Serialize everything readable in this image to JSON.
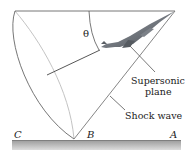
{
  "diagram": {
    "theta_label": "θ",
    "plane_label_line1": "Supersonic",
    "plane_label_line2": "plane",
    "shock_label": "Shock wave",
    "points": {
      "C": "C",
      "B": "B",
      "A": "A"
    }
  },
  "colors": {
    "line": "#555555",
    "back_edge": "#b8b8b8",
    "ground_top": "#9a9a9a",
    "ground_bottom": "#d8d8d8",
    "plane": "#6a6e74"
  }
}
